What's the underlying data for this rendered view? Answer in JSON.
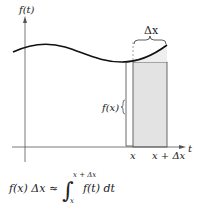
{
  "diagram": {
    "y_axis_label": "f(t)",
    "x_axis_label": "t",
    "delta_label": "Δx",
    "height_label": "f(x)",
    "tick_left_label": "x",
    "tick_right_label": "x + Δx",
    "formula": {
      "lhs": "f(x) Δx ≈",
      "integral_upper": "x + Δx",
      "integral_lower": "x",
      "integrand": "f(t) dt"
    },
    "colors": {
      "curve": "#111111",
      "axes": "#555555",
      "shaded_rect_fill": "#e3e3e3",
      "rect_stroke": "#444444",
      "background": "#ffffff"
    }
  }
}
